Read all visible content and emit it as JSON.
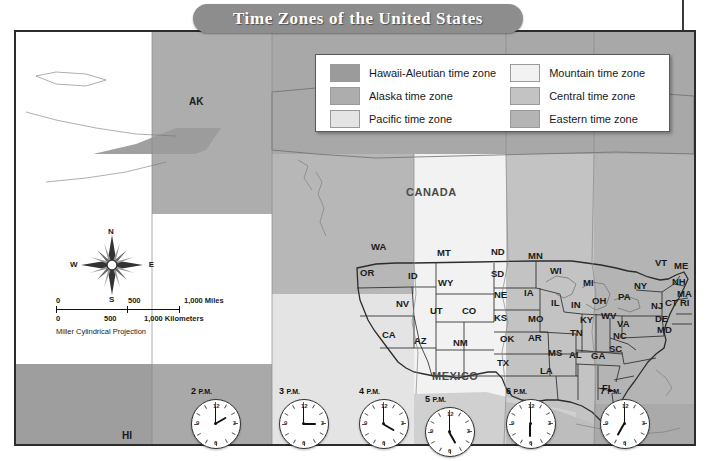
{
  "title": "Time Zones of the United States",
  "legend": {
    "left_column": [
      {
        "label": "Hawaii-Aleutian time zone",
        "color": "#9b9b9b"
      },
      {
        "label": "Alaska time zone",
        "color": "#adadad"
      },
      {
        "label": "Pacific time zone",
        "color": "#e4e4e4"
      }
    ],
    "right_column": [
      {
        "label": "Mountain time zone",
        "color": "#f2f2f2"
      },
      {
        "label": "Central time zone",
        "color": "#c3c3c3"
      },
      {
        "label": "Eastern time zone",
        "color": "#b4b4b4"
      }
    ]
  },
  "compass": {
    "north": "N",
    "south": "S",
    "east": "E",
    "west": "W"
  },
  "scale": {
    "miles": {
      "zero": "0",
      "mid": "500",
      "end": "1,000 Miles"
    },
    "kilometers": {
      "zero": "0",
      "mid": "500",
      "end": "1,000 Kilometers"
    },
    "projection": "Miller Cylindrical Projection"
  },
  "countries": [
    {
      "name": "CANADA",
      "x": 406,
      "y": 186
    },
    {
      "name": "MEXICO",
      "x": 432,
      "y": 370
    }
  ],
  "regions": [
    {
      "name": "AK",
      "x": 189,
      "y": 96
    },
    {
      "name": "HI",
      "x": 122,
      "y": 430
    }
  ],
  "states": [
    {
      "abbr": "WA",
      "x": 371,
      "y": 241
    },
    {
      "abbr": "OR",
      "x": 360,
      "y": 267
    },
    {
      "abbr": "ID",
      "x": 408,
      "y": 270
    },
    {
      "abbr": "MT",
      "x": 437,
      "y": 247
    },
    {
      "abbr": "ND",
      "x": 491,
      "y": 246
    },
    {
      "abbr": "MN",
      "x": 528,
      "y": 250
    },
    {
      "abbr": "WY",
      "x": 438,
      "y": 277
    },
    {
      "abbr": "SD",
      "x": 491,
      "y": 268
    },
    {
      "abbr": "WI",
      "x": 550,
      "y": 265
    },
    {
      "abbr": "MI",
      "x": 583,
      "y": 277
    },
    {
      "abbr": "NV",
      "x": 396,
      "y": 298
    },
    {
      "abbr": "UT",
      "x": 430,
      "y": 305
    },
    {
      "abbr": "CO",
      "x": 462,
      "y": 305
    },
    {
      "abbr": "NE",
      "x": 494,
      "y": 289
    },
    {
      "abbr": "IA",
      "x": 524,
      "y": 287
    },
    {
      "abbr": "IL",
      "x": 551,
      "y": 297
    },
    {
      "abbr": "IN",
      "x": 571,
      "y": 299
    },
    {
      "abbr": "OH",
      "x": 592,
      "y": 295
    },
    {
      "abbr": "PA",
      "x": 618,
      "y": 291
    },
    {
      "abbr": "NY",
      "x": 634,
      "y": 280
    },
    {
      "abbr": "VT",
      "x": 655,
      "y": 257
    },
    {
      "abbr": "ME",
      "x": 674,
      "y": 260
    },
    {
      "abbr": "NH",
      "x": 672,
      "y": 276
    },
    {
      "abbr": "MA",
      "x": 677,
      "y": 288
    },
    {
      "abbr": "CT",
      "x": 665,
      "y": 297
    },
    {
      "abbr": "RI",
      "x": 680,
      "y": 297
    },
    {
      "abbr": "NJ",
      "x": 651,
      "y": 300
    },
    {
      "abbr": "DE",
      "x": 655,
      "y": 313
    },
    {
      "abbr": "MD",
      "x": 657,
      "y": 324
    },
    {
      "abbr": "KS",
      "x": 494,
      "y": 312
    },
    {
      "abbr": "MO",
      "x": 528,
      "y": 313
    },
    {
      "abbr": "KY",
      "x": 580,
      "y": 314
    },
    {
      "abbr": "WV",
      "x": 601,
      "y": 310
    },
    {
      "abbr": "VA",
      "x": 617,
      "y": 318
    },
    {
      "abbr": "CA",
      "x": 382,
      "y": 329
    },
    {
      "abbr": "AZ",
      "x": 414,
      "y": 335
    },
    {
      "abbr": "NM",
      "x": 453,
      "y": 337
    },
    {
      "abbr": "OK",
      "x": 500,
      "y": 333
    },
    {
      "abbr": "AR",
      "x": 528,
      "y": 332
    },
    {
      "abbr": "TN",
      "x": 570,
      "y": 327
    },
    {
      "abbr": "NC",
      "x": 613,
      "y": 330
    },
    {
      "abbr": "SC",
      "x": 609,
      "y": 343
    },
    {
      "abbr": "MS",
      "x": 548,
      "y": 347
    },
    {
      "abbr": "AL",
      "x": 569,
      "y": 349
    },
    {
      "abbr": "GA",
      "x": 591,
      "y": 350
    },
    {
      "abbr": "TX",
      "x": 497,
      "y": 357
    },
    {
      "abbr": "LA",
      "x": 540,
      "y": 365
    },
    {
      "abbr": "FL",
      "x": 602,
      "y": 382
    }
  ],
  "clocks": [
    {
      "time": "2",
      "period": "P.M.",
      "hour_deg": 60,
      "minute_deg": 0,
      "x": 191,
      "y": 386
    },
    {
      "time": "3",
      "period": "P.M.",
      "hour_deg": 90,
      "minute_deg": 0,
      "x": 279,
      "y": 386
    },
    {
      "time": "4",
      "period": "P.M.",
      "hour_deg": 120,
      "minute_deg": 0,
      "x": 359,
      "y": 386
    },
    {
      "time": "5",
      "period": "P.M.",
      "hour_deg": 150,
      "minute_deg": 0,
      "x": 425,
      "y": 394
    },
    {
      "time": "6",
      "period": "P.M.",
      "hour_deg": 180,
      "minute_deg": 0,
      "x": 506,
      "y": 386
    },
    {
      "time": "7",
      "period": "P.M.",
      "hour_deg": 210,
      "minute_deg": 0,
      "x": 600,
      "y": 386
    }
  ],
  "clock_numerals": {
    "n12": "12",
    "n3": "3",
    "n6": "6",
    "n9": "9"
  }
}
